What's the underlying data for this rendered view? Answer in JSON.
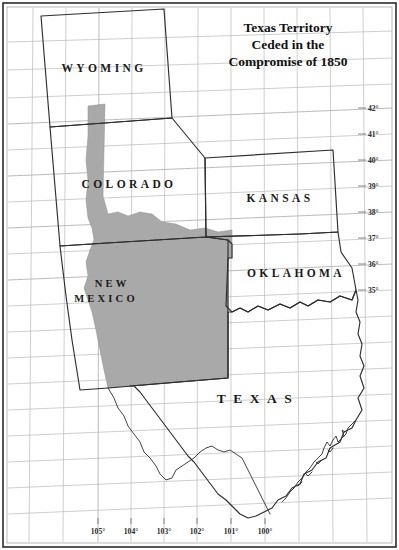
{
  "map": {
    "title_lines": [
      "Texas Territory",
      "Ceded in the",
      "Compromise of 1850"
    ],
    "title_line1": "Texas Territory",
    "title_line2": "Ceded in the",
    "title_line3": "Compromise of 1850",
    "state_labels": [
      {
        "name": "wyoming",
        "text": "WYOMING"
      },
      {
        "name": "colorado",
        "text": "COLORADO"
      },
      {
        "name": "kansas",
        "text": "KANSAS"
      },
      {
        "name": "oklahoma",
        "text": "OKLAHOMA"
      },
      {
        "name": "new-mexico-line1",
        "text": "NEW"
      },
      {
        "name": "new-mexico-line2",
        "text": "MEXICO"
      },
      {
        "name": "texas",
        "text": "TEXAS"
      }
    ],
    "latitude_labels": [
      "42°",
      "41°",
      "40°",
      "39°",
      "38°",
      "37°",
      "36°",
      "35°"
    ],
    "longitude_labels": [
      "105°",
      "104°",
      "103°",
      "102°",
      "101°",
      "100°"
    ],
    "legend": {
      "ceded_fill_color": "#a9a9a9",
      "background_color": "#ffffff",
      "outline_color": "#2e2e2e",
      "grid_color": "#b9b9b9"
    }
  }
}
